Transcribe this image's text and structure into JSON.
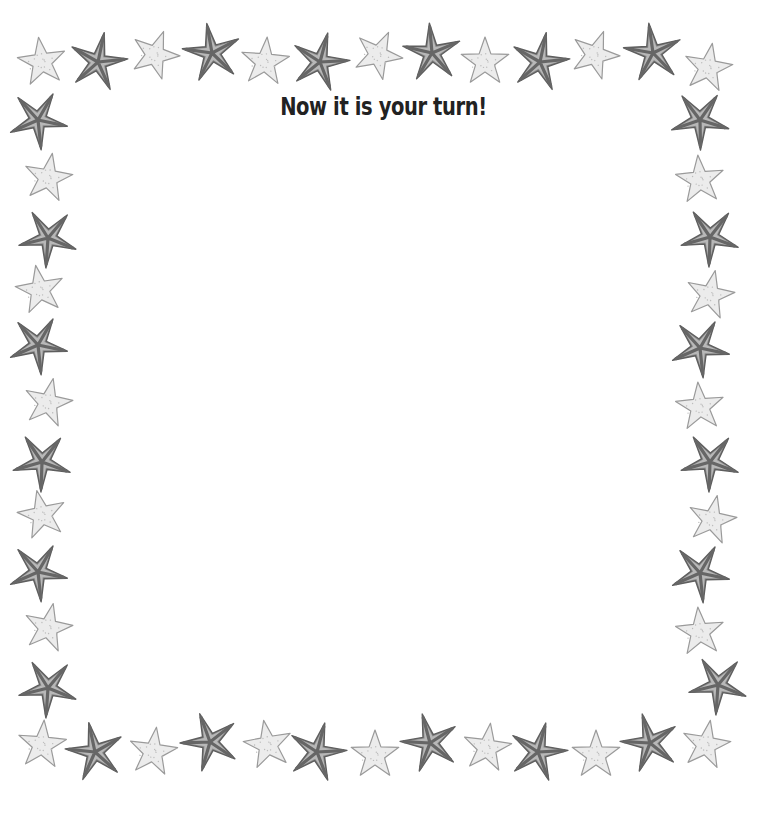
{
  "page": {
    "title": "Now it is your turn!"
  },
  "colors": {
    "background": "#ffffff",
    "title_text": "#222222",
    "dark_star_fill": "#8a8a8a",
    "dark_star_stroke": "#5e5e5e",
    "dark_star_stripe": "#666666",
    "light_star_fill": "#ececec",
    "light_star_stroke": "#9a9a9a"
  },
  "border": {
    "stars": [
      {
        "x": 42,
        "y": 62,
        "type": "light",
        "rot": -8
      },
      {
        "x": 98,
        "y": 62,
        "type": "dark",
        "rot": 12
      },
      {
        "x": 155,
        "y": 55,
        "type": "light",
        "rot": 20
      },
      {
        "x": 212,
        "y": 53,
        "type": "dark",
        "rot": -10
      },
      {
        "x": 265,
        "y": 62,
        "type": "light",
        "rot": 5
      },
      {
        "x": 320,
        "y": 62,
        "type": "dark",
        "rot": 15
      },
      {
        "x": 378,
        "y": 55,
        "type": "light",
        "rot": 25
      },
      {
        "x": 432,
        "y": 53,
        "type": "dark",
        "rot": -5
      },
      {
        "x": 485,
        "y": 62,
        "type": "light",
        "rot": 0
      },
      {
        "x": 540,
        "y": 62,
        "type": "dark",
        "rot": 12
      },
      {
        "x": 595,
        "y": 55,
        "type": "light",
        "rot": 20
      },
      {
        "x": 653,
        "y": 53,
        "type": "dark",
        "rot": -8
      },
      {
        "x": 708,
        "y": 68,
        "type": "light",
        "rot": 10
      },
      {
        "x": 38,
        "y": 120,
        "type": "dark",
        "rot": 30
      },
      {
        "x": 48,
        "y": 178,
        "type": "light",
        "rot": 10
      },
      {
        "x": 48,
        "y": 238,
        "type": "dark",
        "rot": 40
      },
      {
        "x": 40,
        "y": 290,
        "type": "light",
        "rot": -10
      },
      {
        "x": 38,
        "y": 345,
        "type": "dark",
        "rot": 30
      },
      {
        "x": 48,
        "y": 403,
        "type": "light",
        "rot": 12
      },
      {
        "x": 42,
        "y": 462,
        "type": "dark",
        "rot": 38
      },
      {
        "x": 42,
        "y": 515,
        "type": "light",
        "rot": -12
      },
      {
        "x": 38,
        "y": 572,
        "type": "dark",
        "rot": 30
      },
      {
        "x": 48,
        "y": 628,
        "type": "light",
        "rot": 12
      },
      {
        "x": 48,
        "y": 688,
        "type": "dark",
        "rot": 40
      },
      {
        "x": 700,
        "y": 120,
        "type": "dark",
        "rot": 35
      },
      {
        "x": 700,
        "y": 180,
        "type": "light",
        "rot": -5
      },
      {
        "x": 710,
        "y": 237,
        "type": "dark",
        "rot": 38
      },
      {
        "x": 710,
        "y": 295,
        "type": "light",
        "rot": 12
      },
      {
        "x": 700,
        "y": 348,
        "type": "dark",
        "rot": 30
      },
      {
        "x": 700,
        "y": 407,
        "type": "light",
        "rot": -5
      },
      {
        "x": 710,
        "y": 462,
        "type": "dark",
        "rot": 38
      },
      {
        "x": 712,
        "y": 520,
        "type": "light",
        "rot": 12
      },
      {
        "x": 700,
        "y": 573,
        "type": "dark",
        "rot": 30
      },
      {
        "x": 700,
        "y": 632,
        "type": "light",
        "rot": -5
      },
      {
        "x": 718,
        "y": 685,
        "type": "dark",
        "rot": 40
      },
      {
        "x": 42,
        "y": 745,
        "type": "light",
        "rot": 5
      },
      {
        "x": 95,
        "y": 752,
        "type": "dark",
        "rot": -12
      },
      {
        "x": 153,
        "y": 752,
        "type": "light",
        "rot": 8
      },
      {
        "x": 210,
        "y": 742,
        "type": "dark",
        "rot": -20
      },
      {
        "x": 268,
        "y": 745,
        "type": "light",
        "rot": -10
      },
      {
        "x": 317,
        "y": 752,
        "type": "dark",
        "rot": 15
      },
      {
        "x": 375,
        "y": 755,
        "type": "light",
        "rot": 0
      },
      {
        "x": 430,
        "y": 743,
        "type": "dark",
        "rot": -15
      },
      {
        "x": 487,
        "y": 748,
        "type": "light",
        "rot": 8
      },
      {
        "x": 538,
        "y": 752,
        "type": "dark",
        "rot": 15
      },
      {
        "x": 596,
        "y": 755,
        "type": "light",
        "rot": 0
      },
      {
        "x": 650,
        "y": 743,
        "type": "dark",
        "rot": -15
      },
      {
        "x": 706,
        "y": 745,
        "type": "light",
        "rot": 10
      }
    ]
  }
}
